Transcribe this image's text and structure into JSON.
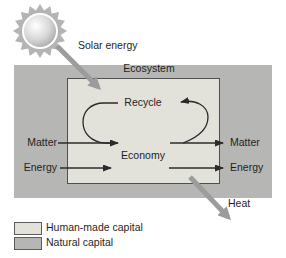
{
  "figure": {
    "solar_label": "Solar energy",
    "ecosystem_label": "Ecosystem",
    "recycle_label": "Recycle",
    "economy_label": "Economy",
    "heat_label": "Heat",
    "left_flows": [
      {
        "label": "Matter"
      },
      {
        "label": "Energy"
      }
    ],
    "right_flows": [
      {
        "label": "Matter"
      },
      {
        "label": "Energy"
      }
    ]
  },
  "legend": {
    "items": [
      {
        "label": "Human-made capital",
        "color": "#e2e1da"
      },
      {
        "label": "Natural capital",
        "color": "#b6b6b4"
      }
    ]
  },
  "colors": {
    "outer_box": "#b6b6b4",
    "inner_box": "#e2e1da",
    "thick_arrow": "#9c9c9c",
    "thin_arrow": "#2b2b2b",
    "sun_spikes": "#b4b4b4",
    "background": "#ffffff"
  }
}
